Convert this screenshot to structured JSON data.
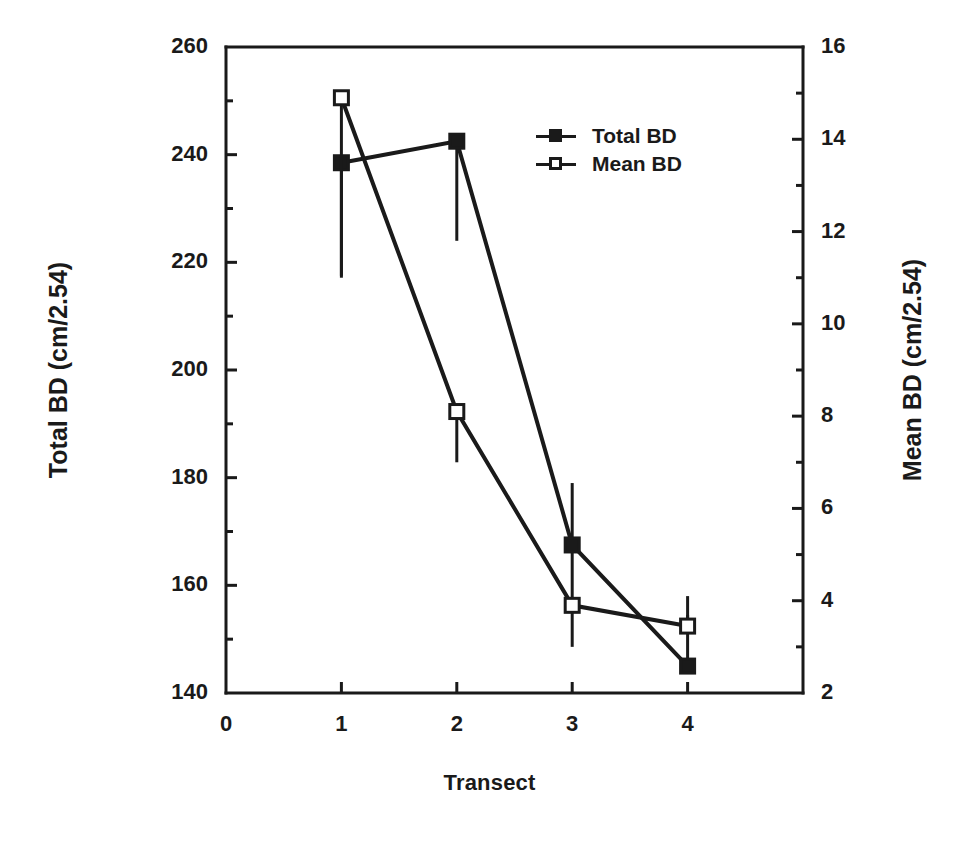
{
  "chart_data": {
    "type": "line",
    "title": "",
    "xlabel": "Transect",
    "ylabel": "Total BD (cm/2.54)",
    "y2label": "Mean BD (cm/2.54)",
    "x": [
      1,
      2,
      3,
      4
    ],
    "xtick_labels": [
      "0",
      "1",
      "2",
      "3",
      "4"
    ],
    "xtick_values": [
      0,
      1,
      2,
      3,
      4
    ],
    "xlim": [
      0,
      5
    ],
    "ylim": [
      140,
      260
    ],
    "ytick_labels": [
      "140",
      "160",
      "180",
      "200",
      "220",
      "240",
      "260"
    ],
    "ytick_values": [
      140,
      160,
      180,
      200,
      220,
      240,
      260
    ],
    "y2lim": [
      2,
      16
    ],
    "y2tick_labels": [
      "2",
      "4",
      "6",
      "8",
      "10",
      "12",
      "14",
      "16"
    ],
    "y2tick_values": [
      2,
      4,
      6,
      8,
      10,
      12,
      14,
      16
    ],
    "minor_ticks": true,
    "grid": false,
    "legend_position": "upper-center",
    "series": [
      {
        "name": "Total BD",
        "axis": "left",
        "marker": "filled-square",
        "values": [
          238.5,
          242.5,
          167.5,
          145.0
        ],
        "err_low": [
          217.5,
          224.0,
          155.5,
          154.5
        ],
        "err_high": [
          238.5,
          242.5,
          179.0,
          145.0
        ]
      },
      {
        "name": "Mean BD",
        "axis": "right",
        "marker": "open-square",
        "values": [
          14.9,
          8.1,
          3.9,
          3.45
        ],
        "err_low": [
          11.0,
          7.0,
          3.0,
          3.45
        ],
        "err_high": [
          14.9,
          8.1,
          3.9,
          4.1
        ]
      }
    ]
  },
  "legend": {
    "items": [
      {
        "label": "Total BD",
        "marker": "filled-square"
      },
      {
        "label": "Mean BD",
        "marker": "open-square"
      }
    ]
  },
  "colors": {
    "ink": "#1a1a1a",
    "background": "#ffffff"
  }
}
